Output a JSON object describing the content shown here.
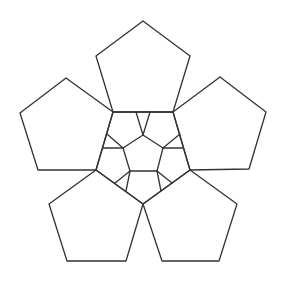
{
  "figure": {
    "stroke_color": "#333333",
    "stroke_width": 1.3,
    "background": "#ffffff",
    "width": 290,
    "height": 287
  },
  "outer_pentagons": [
    {
      "name": "top",
      "points": "143,21 190,56 173,112 113,112 96,56"
    },
    {
      "name": "upper-right",
      "points": "220,77 266,112 249,169 190,170 173,112"
    },
    {
      "name": "upper-left",
      "points": "66,78 113,112 96,170 38,170 20,113"
    },
    {
      "name": "lower-right",
      "points": "190,170 237,204 219,261 162,261 143,204"
    },
    {
      "name": "lower-left",
      "points": "96,170 143,204 126,261 67,261 49,204"
    }
  ],
  "ring_pentagon": {
    "points": "113,112 173,112 190,170 143,204 96,170"
  },
  "center_pentagon": {
    "points": "143,135 163,148 157,171 130,171 123,148"
  },
  "spokes": [
    {
      "x1": 143,
      "y1": 135,
      "x2": 136,
      "y2": 112
    },
    {
      "x1": 143,
      "y1": 135,
      "x2": 150,
      "y2": 112
    },
    {
      "x1": 163,
      "y1": 148,
      "x2": 180,
      "y2": 134
    },
    {
      "x1": 163,
      "y1": 148,
      "x2": 183,
      "y2": 148
    },
    {
      "x1": 157,
      "y1": 171,
      "x2": 172,
      "y2": 183
    },
    {
      "x1": 157,
      "y1": 171,
      "x2": 161,
      "y2": 191
    },
    {
      "x1": 130,
      "y1": 171,
      "x2": 126,
      "y2": 191
    },
    {
      "x1": 130,
      "y1": 171,
      "x2": 115,
      "y2": 183
    },
    {
      "x1": 123,
      "y1": 148,
      "x2": 103,
      "y2": 148
    },
    {
      "x1": 123,
      "y1": 148,
      "x2": 107,
      "y2": 134
    }
  ]
}
